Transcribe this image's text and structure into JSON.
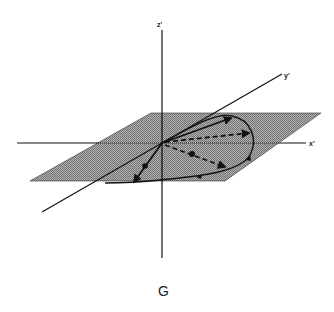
{
  "figure": {
    "caption": "G",
    "axes": {
      "x": "x'",
      "y": "y'",
      "z": "z'"
    },
    "plane": {
      "fill": "#9a9a9a",
      "pattern": "stippled gray"
    },
    "elements": {
      "solid_vectors": [
        "origin-to-upper-right-vector",
        "origin-to-lower-left-vector"
      ],
      "dashed_vectors": [
        "origin-to-right-vector",
        "origin-to-lower-right-vector"
      ],
      "trajectory": "closed loop curve in plane with direction arrows"
    },
    "colors": {
      "line": "#111111",
      "plane": "#9a9a9a",
      "background": "#ffffff"
    }
  }
}
